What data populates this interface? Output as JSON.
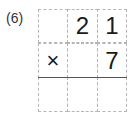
{
  "problem": {
    "label": "(6)",
    "rows": [
      [
        "",
        "2",
        "1"
      ],
      [
        "×",
        "",
        "7"
      ],
      [
        "",
        "",
        ""
      ]
    ]
  }
}
